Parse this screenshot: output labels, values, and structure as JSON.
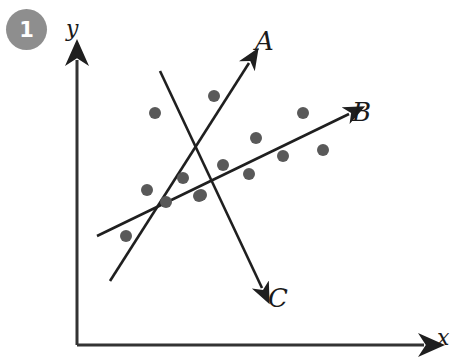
{
  "figure": {
    "badge_number": "1",
    "axes": {
      "y_label": "y",
      "x_label": "x",
      "axis_color": "#333333"
    },
    "dot_color": "#595959",
    "line_color": "#1f1f1f",
    "background": "#ffffff",
    "badge_color": "#8e8e8e"
  },
  "labels": {
    "line_a": "A",
    "line_b": "B",
    "line_c": "C"
  },
  "chart_data": {
    "type": "scatter",
    "title": "",
    "xlabel": "x",
    "ylabel": "y",
    "grid": false,
    "legend": "none",
    "annotations": [
      "A",
      "B",
      "C",
      "1"
    ],
    "points_px": [
      [
        155,
        113
      ],
      [
        214,
        96
      ],
      [
        303,
        113
      ],
      [
        256,
        138
      ],
      [
        323,
        150
      ],
      [
        283,
        156
      ],
      [
        223,
        165
      ],
      [
        249,
        174
      ],
      [
        183,
        178
      ],
      [
        147,
        190
      ],
      [
        201,
        195
      ],
      [
        166,
        202
      ],
      [
        126,
        236
      ],
      [
        199,
        196
      ]
    ],
    "points_xy": [
      {
        "x": 2.6,
        "y": 7.6
      },
      {
        "x": 4.6,
        "y": 8.2
      },
      {
        "x": 7.6,
        "y": 7.6
      },
      {
        "x": 6.0,
        "y": 6.8
      },
      {
        "x": 8.3,
        "y": 6.4
      },
      {
        "x": 7.0,
        "y": 6.2
      },
      {
        "x": 4.9,
        "y": 5.9
      },
      {
        "x": 5.8,
        "y": 5.6
      },
      {
        "x": 3.6,
        "y": 5.5
      },
      {
        "x": 2.4,
        "y": 5.1
      },
      {
        "x": 4.2,
        "y": 4.9
      },
      {
        "x": 3.0,
        "y": 4.7
      },
      {
        "x": 1.7,
        "y": 3.5
      }
    ],
    "lines": [
      {
        "name": "A",
        "from_px": [
          110,
          281
        ],
        "to_px": [
          253,
          58
        ],
        "slope": "steep positive",
        "arrow": "end"
      },
      {
        "name": "B",
        "from_px": [
          97,
          236
        ],
        "to_px": [
          355,
          112
        ],
        "slope": "shallow positive",
        "arrow": "end"
      },
      {
        "name": "C",
        "from_px": [
          160,
          71
        ],
        "to_px": [
          266,
          296
        ],
        "slope": "negative",
        "arrow": "end"
      }
    ],
    "axis_px": {
      "origin": [
        77,
        345
      ],
      "y_top": [
        77,
        52
      ],
      "x_right": [
        432,
        345
      ]
    }
  }
}
